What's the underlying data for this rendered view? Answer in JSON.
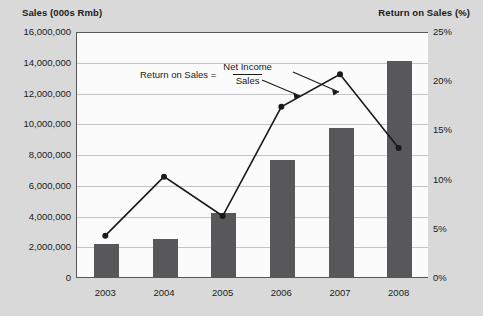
{
  "left_axis_title": "Sales (000s Rmb)",
  "right_axis_title": "Return on Sales (%)",
  "annotation": {
    "lhs": "Return on Sales =",
    "numerator": "Net Income",
    "denominator": "Sales"
  },
  "colors": {
    "background": "#d9d9d9",
    "plot_background": "#fbfbfb",
    "bar": "#58585a",
    "line": "#1a1a1a",
    "gridline": "#c4c4c4",
    "axis": "#58585a",
    "text": "#1a1a1a"
  },
  "chart_data": {
    "type": "bar",
    "title": "",
    "xlabel": "",
    "categories": [
      "2003",
      "2004",
      "2005",
      "2006",
      "2007",
      "2008"
    ],
    "series": [
      {
        "name": "Sales (000s Rmb)",
        "type": "bar",
        "axis": "left",
        "values": [
          2200000,
          2550000,
          4200000,
          7700000,
          9750000,
          14100000
        ]
      },
      {
        "name": "Return on Sales (%)",
        "type": "line",
        "axis": "right",
        "values": [
          4.3,
          10.3,
          6.3,
          17.4,
          20.7,
          13.2
        ]
      }
    ],
    "left_axis": {
      "label": "Sales (000s Rmb)",
      "ylim": [
        0,
        16000000
      ],
      "ticks": [
        0,
        2000000,
        4000000,
        6000000,
        8000000,
        10000000,
        12000000,
        14000000,
        16000000
      ],
      "tick_labels": [
        "0",
        "2,000,000",
        "4,000,000",
        "6,000,000",
        "8,000,000",
        "10,000,000",
        "12,000,000",
        "14,000,000",
        "16,000,000"
      ]
    },
    "right_axis": {
      "label": "Return on Sales (%)",
      "ylim": [
        0,
        25
      ],
      "ticks": [
        0,
        5,
        10,
        15,
        20,
        25
      ],
      "tick_labels": [
        "0%",
        "5%",
        "10%",
        "15%",
        "20%",
        "25%"
      ]
    },
    "grid": true,
    "legend": "none",
    "annotations": [
      "Return on Sales = Net Income / Sales"
    ]
  }
}
